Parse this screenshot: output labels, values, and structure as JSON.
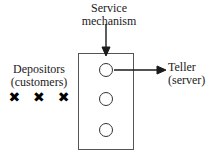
{
  "diagram": {
    "background_color": "#ffffff",
    "line_color": "#333333",
    "text_color": "#1a1a1a"
  },
  "labels": {
    "service_mechanism": {
      "line1": "Service",
      "line2": "mechanism"
    },
    "depositors": {
      "line1": "Depositors",
      "line2": "(customers)"
    },
    "teller": {
      "line1": "Teller",
      "line2": "(server)"
    }
  },
  "customers": {
    "glyph": "✖",
    "count": 3,
    "marks": [
      "✖",
      "✖",
      "✖"
    ]
  },
  "service_box": {
    "slot_count": 3,
    "slots": [
      "slot-1",
      "slot-2",
      "slot-3"
    ]
  },
  "arrows": {
    "service_pointer": "down-arrow",
    "teller_pointer": "right-arrow"
  }
}
